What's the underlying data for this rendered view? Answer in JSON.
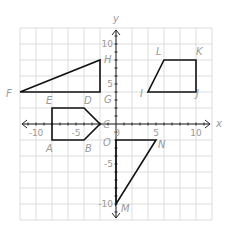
{
  "diagram": {
    "type": "coordinate-plane",
    "axis_labels": {
      "x": "x",
      "y": "y"
    },
    "range": {
      "xmin": -12,
      "xmax": 12,
      "ymin": -12,
      "ymax": 12
    },
    "grid_step": 2,
    "tick_labels": {
      "x": [
        {
          "value": -10,
          "text": "-10"
        },
        {
          "value": -5,
          "text": "-5"
        },
        {
          "value": 0,
          "text": "0"
        },
        {
          "value": 5,
          "text": "5"
        },
        {
          "value": 10,
          "text": "10"
        }
      ],
      "y": [
        {
          "value": 10,
          "text": "10"
        },
        {
          "value": 5,
          "text": "5"
        },
        {
          "value": -5,
          "text": "-5"
        },
        {
          "value": -10,
          "text": "-10"
        }
      ]
    },
    "shapes": [
      {
        "name": "triangle-FGH",
        "vertices": [
          {
            "label": "F",
            "x": -12,
            "y": 4
          },
          {
            "label": "G",
            "x": -2,
            "y": 4
          },
          {
            "label": "H",
            "x": -2,
            "y": 8
          }
        ]
      },
      {
        "name": "pentagon-ABCDE",
        "vertices": [
          {
            "label": "A",
            "x": -8,
            "y": -2
          },
          {
            "label": "B",
            "x": -4,
            "y": -2
          },
          {
            "label": "C",
            "x": -2,
            "y": 0
          },
          {
            "label": "D",
            "x": -4,
            "y": 2
          },
          {
            "label": "E",
            "x": -8,
            "y": 2
          }
        ]
      },
      {
        "name": "trapezoid-IJKL",
        "vertices": [
          {
            "label": "I",
            "x": 4,
            "y": 4
          },
          {
            "label": "J",
            "x": 10,
            "y": 4
          },
          {
            "label": "K",
            "x": 10,
            "y": 8
          },
          {
            "label": "L",
            "x": 6,
            "y": 8
          }
        ]
      },
      {
        "name": "triangle-OMN",
        "vertices": [
          {
            "label": "O",
            "x": 0,
            "y": -2
          },
          {
            "label": "N",
            "x": 5,
            "y": -2
          },
          {
            "label": "M",
            "x": 0,
            "y": -10
          }
        ]
      }
    ],
    "vertex_labels": [
      {
        "text": "F",
        "px": 6,
        "py": 97
      },
      {
        "text": "G",
        "px": 104,
        "py": 103
      },
      {
        "text": "H",
        "px": 104,
        "py": 63
      },
      {
        "text": "E",
        "px": 46,
        "py": 104
      },
      {
        "text": "D",
        "px": 84,
        "py": 104
      },
      {
        "text": "C",
        "px": 103,
        "py": 128
      },
      {
        "text": "B",
        "px": 85,
        "py": 152
      },
      {
        "text": "A",
        "px": 46,
        "py": 152
      },
      {
        "text": "L",
        "px": 156,
        "py": 55
      },
      {
        "text": "K",
        "px": 196,
        "py": 55
      },
      {
        "text": "I",
        "px": 140,
        "py": 97
      },
      {
        "text": "J",
        "px": 196,
        "py": 97
      },
      {
        "text": "O",
        "px": 103,
        "py": 146
      },
      {
        "text": "N",
        "px": 158,
        "py": 148
      },
      {
        "text": "M",
        "px": 121,
        "py": 212
      }
    ]
  }
}
